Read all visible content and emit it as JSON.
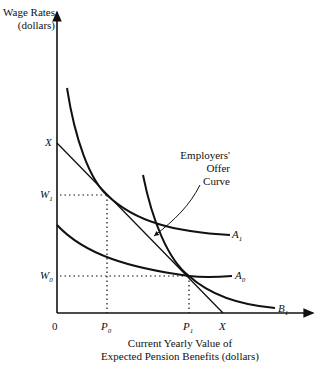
{
  "diagram": {
    "y_axis_label_line1": "Wage Rates",
    "y_axis_label_line2": "(dollars)",
    "x_axis_label_line1": "Current Yearly Value of",
    "x_axis_label_line2": "Expected Pension Benefits (dollars)",
    "origin_label": "0",
    "y_ticks": {
      "x_intercept": "X",
      "w1": "W",
      "w1_sub": "1",
      "w0": "W",
      "w0_sub": "0"
    },
    "x_ticks": {
      "p0": "P",
      "p0_sub": "0",
      "p1": "P",
      "p1_sub": "1",
      "x_intercept": "X"
    },
    "curves": {
      "a1": {
        "label": "A",
        "sub": "1"
      },
      "a0": {
        "label": "A",
        "sub": "0"
      },
      "b1": {
        "label": "B",
        "sub": "1"
      }
    },
    "annotation_line1": "Employers'",
    "annotation_line2": "Offer",
    "annotation_line3": "Curve"
  }
}
